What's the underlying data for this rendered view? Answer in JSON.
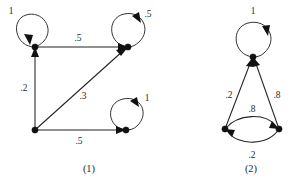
{
  "figure": {
    "background": "#ffffff",
    "ink_color": "#222222",
    "captions": [
      {
        "id": "caption-1",
        "text": "(1)",
        "x": 89,
        "y": 170
      },
      {
        "id": "caption-2",
        "text": "(2)",
        "x": 251,
        "y": 170
      }
    ]
  },
  "graph_one": {
    "name": "markov-chain-diagram-1",
    "nodes": [
      {
        "id": "g1-node-top-left",
        "x": 35,
        "y": 47
      },
      {
        "id": "g1-node-top-right",
        "x": 128,
        "y": 47
      },
      {
        "id": "g1-node-bottom-left",
        "x": 35,
        "y": 130
      },
      {
        "id": "g1-node-bottom-right",
        "x": 126,
        "y": 130
      }
    ],
    "self_loops": [
      {
        "id": "g1-loop-top-left",
        "node": "g1-node-top-left",
        "label": "1",
        "label_x": 11,
        "label_y": 12
      },
      {
        "id": "g1-loop-top-right",
        "node": "g1-node-top-right",
        "label": ".5",
        "label_x": 148,
        "label_y": 15
      },
      {
        "id": "g1-loop-bottom-right",
        "node": "g1-node-bottom-right",
        "label": "1",
        "label_x": 147,
        "label_y": 99
      }
    ],
    "edges": [
      {
        "id": "g1-edge-topleft-topright",
        "from": "g1-node-top-left",
        "to": "g1-node-top-right",
        "label": ".5",
        "label_x": 78,
        "label_y": 39
      },
      {
        "id": "g1-edge-bottomleft-topleft",
        "from": "g1-node-bottom-left",
        "to": "g1-node-top-left",
        "label": ".2",
        "label_x": 24,
        "label_y": 89
      },
      {
        "id": "g1-edge-bottomleft-topright",
        "from": "g1-node-bottom-left",
        "to": "g1-node-top-right",
        "label": ".3",
        "label_x": 83,
        "label_y": 97
      },
      {
        "id": "g1-edge-bottomleft-bottomright",
        "from": "g1-node-bottom-left",
        "to": "g1-node-bottom-right",
        "label": ".5",
        "label_x": 79,
        "label_y": 142
      }
    ]
  },
  "graph_two": {
    "name": "markov-chain-diagram-2",
    "nodes": [
      {
        "id": "g2-node-apex",
        "x": 253,
        "y": 57
      },
      {
        "id": "g2-node-bottom-left",
        "x": 225,
        "y": 129
      },
      {
        "id": "g2-node-bottom-right",
        "x": 279,
        "y": 129
      }
    ],
    "self_loops": [
      {
        "id": "g2-loop-apex",
        "node": "g2-node-apex",
        "label": "1",
        "label_x": 253,
        "label_y": 12
      }
    ],
    "edges": [
      {
        "id": "g2-edge-bottomleft-apex",
        "from": "g2-node-bottom-left",
        "to": "g2-node-apex",
        "label": ".2",
        "label_x": 229,
        "label_y": 96
      },
      {
        "id": "g2-edge-bottomright-apex",
        "from": "g2-node-bottom-right",
        "to": "g2-node-apex",
        "label": ".8",
        "label_x": 277,
        "label_y": 96
      },
      {
        "id": "g2-edge-bottomleft-bottomright-upper",
        "from": "g2-node-bottom-left",
        "to": "g2-node-bottom-right",
        "label": ".8",
        "label_x": 252,
        "label_y": 110
      },
      {
        "id": "g2-edge-bottomright-bottomleft-lower",
        "from": "g2-node-bottom-right",
        "to": "g2-node-bottom-left",
        "label": ".2",
        "label_x": 252,
        "label_y": 156
      }
    ]
  }
}
